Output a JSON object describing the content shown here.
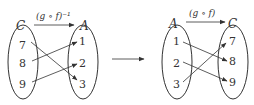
{
  "left_diagram": {
    "domain_set": "C",
    "codomain_set": "A",
    "function_label": "(g ∘ f)⁻¹",
    "domain_elements": [
      "7",
      "8",
      "9"
    ],
    "codomain_elements": [
      "1",
      "2",
      "3"
    ],
    "mappings": [
      {
        "from": "7",
        "to": "3"
      },
      {
        "from": "8",
        "to": "1"
      },
      {
        "from": "9",
        "to": "2"
      }
    ]
  },
  "right_diagram": {
    "domain_set": "A",
    "codomain_set": "C",
    "function_label": "(g ∘ f)",
    "domain_elements": [
      "1",
      "2",
      "3"
    ],
    "codomain_elements": [
      "7",
      "8",
      "9"
    ],
    "mappings": [
      {
        "from": "1",
        "to": "8"
      },
      {
        "from": "2",
        "to": "9"
      },
      {
        "from": "3",
        "to": "7"
      }
    ]
  },
  "transition_arrow": "→"
}
